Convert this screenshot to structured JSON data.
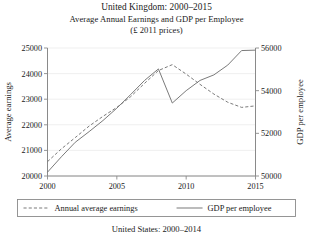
{
  "title": {
    "line1": "United Kingdom: 2000–2015",
    "line2": "Average Annual Earnings and GDP per Employee",
    "line3": "(£ 2011 prices)"
  },
  "caption": "United States: 2000–2014",
  "chart_data": {
    "type": "line",
    "xlabel": "",
    "ylabel": "Average earnings",
    "y2label": "GDP per employee",
    "grid": true,
    "legend_position": "bottom",
    "x": [
      2000,
      2001,
      2002,
      2003,
      2004,
      2005,
      2006,
      2007,
      2008,
      2009,
      2010,
      2011,
      2012,
      2013,
      2014,
      2015
    ],
    "xlim": [
      2000,
      2015
    ],
    "xticks": [
      2000,
      2005,
      2010,
      2015
    ],
    "xticklabels": [
      "2000",
      "2005",
      "2010",
      "2015"
    ],
    "ylim": [
      20000,
      25000
    ],
    "yticks": [
      20000,
      21000,
      22000,
      23000,
      24000,
      25000
    ],
    "yticklabels": [
      "20000",
      "21000",
      "22000",
      "23000",
      "24000",
      "25000"
    ],
    "y2lim": [
      50000,
      56000
    ],
    "y2ticks": [
      50000,
      52000,
      54000,
      56000
    ],
    "y2ticklabels": [
      "50000",
      "52000",
      "54000",
      "56000"
    ],
    "series": [
      {
        "name": "Annual average earnings",
        "axis": "left",
        "style": "dashed",
        "values": [
          20560,
          21060,
          21500,
          21950,
          22330,
          22680,
          23100,
          23620,
          24120,
          24350,
          23980,
          23580,
          23200,
          22880,
          22680,
          22740
        ]
      },
      {
        "name": "GDP per employee",
        "axis": "right",
        "style": "solid",
        "values": [
          50180,
          50900,
          51580,
          52080,
          52600,
          53180,
          53820,
          54480,
          55020,
          53420,
          54000,
          54480,
          54740,
          55200,
          55880,
          55900
        ]
      }
    ]
  },
  "legend": {
    "items": [
      {
        "label": "Annual average earnings",
        "style": "dashed"
      },
      {
        "label": "GDP per employee",
        "style": "solid"
      }
    ]
  }
}
